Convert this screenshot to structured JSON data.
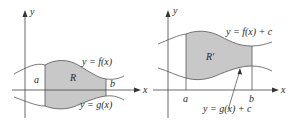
{
  "figure": {
    "left": {
      "axis_x_label": "x",
      "axis_y_label": "y",
      "upper_curve_label": "y = f(x)",
      "lower_curve_label": "y = g(x)",
      "region_label": "R",
      "left_bound_label": "a",
      "right_bound_label": "b"
    },
    "right": {
      "axis_x_label": "x",
      "axis_y_label": "y",
      "upper_curve_label": "y = f(x) + c",
      "lower_curve_label": "y = g(x) + c",
      "region_label": "R'",
      "left_bound_label": "a",
      "right_bound_label": "b"
    },
    "colors": {
      "shade": "#c8c8c8",
      "line": "#555555"
    }
  }
}
